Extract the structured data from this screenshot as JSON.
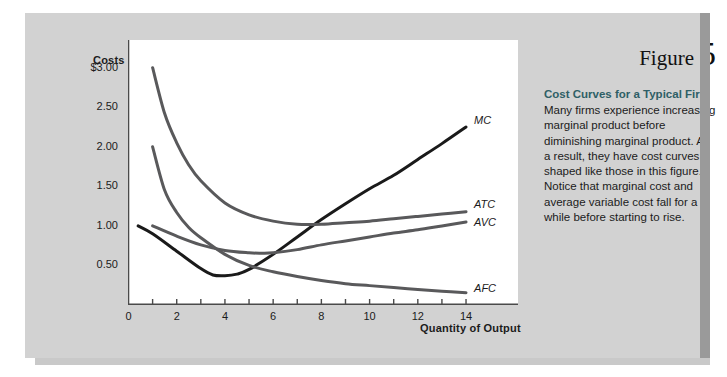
{
  "figure": {
    "word": "Figure",
    "number": "5",
    "caption_title": "Cost Curves for a Typical Firm",
    "caption_body": "Many firms experience increasing marginal product before diminishing marginal product. As a result, they have cost curves shaped like those in this figure. Notice that marginal cost and average variable cost fall for a while before starting to rise.",
    "title_color": "#2f5f66"
  },
  "chart_data": {
    "type": "line",
    "title": "Cost Curves for a Typical Firm",
    "xlabel": "Quantity of Output",
    "ylabel": "Costs",
    "xlim": [
      0,
      14.6
    ],
    "ylim": [
      0,
      3.35
    ],
    "grid": false,
    "legend": "inline-right-labels",
    "xticks": [
      0,
      1,
      2,
      3,
      4,
      5,
      6,
      7,
      8,
      9,
      10,
      11,
      12,
      13,
      14
    ],
    "xtick_labels": [
      "0",
      "",
      "2",
      "",
      "4",
      "",
      "6",
      "",
      "8",
      "",
      "10",
      "",
      "12",
      "",
      "14"
    ],
    "yticks": [
      0.25,
      0.5,
      0.75,
      1.0,
      1.25,
      1.5,
      1.75,
      2.0,
      2.25,
      2.5,
      2.75,
      3.0
    ],
    "ytick_labels": [
      "",
      "0.50",
      "",
      "1.00",
      "",
      "1.50",
      "",
      "2.00",
      "",
      "2.50",
      "",
      "$3.00"
    ],
    "series": [
      {
        "name": "MC",
        "label": "MC",
        "color": "#1a1a1a",
        "width": 3.0,
        "x": [
          0.4,
          1,
          2,
          3,
          3.5,
          4,
          4.5,
          5,
          6,
          7,
          8,
          9,
          10,
          11,
          12,
          13,
          14
        ],
        "y": [
          1.0,
          0.9,
          0.68,
          0.46,
          0.38,
          0.37,
          0.39,
          0.45,
          0.64,
          0.86,
          1.08,
          1.28,
          1.47,
          1.64,
          1.84,
          2.04,
          2.25
        ]
      },
      {
        "name": "ATC",
        "label": "ATC",
        "color": "#59595b",
        "width": 3.0,
        "x": [
          1,
          1.5,
          2,
          2.5,
          3,
          4,
          5,
          6,
          7,
          8,
          9,
          10,
          11,
          12,
          13,
          14
        ],
        "y": [
          3.0,
          2.42,
          2.05,
          1.77,
          1.57,
          1.29,
          1.14,
          1.06,
          1.02,
          1.02,
          1.04,
          1.06,
          1.09,
          1.12,
          1.15,
          1.18
        ]
      },
      {
        "name": "AVC",
        "label": "AVC",
        "color": "#59595b",
        "width": 3.0,
        "x": [
          1,
          2,
          3,
          4,
          5,
          5.5,
          6,
          7,
          8,
          9,
          10,
          11,
          12,
          13,
          14
        ],
        "y": [
          1.0,
          0.87,
          0.76,
          0.69,
          0.66,
          0.655,
          0.66,
          0.7,
          0.76,
          0.81,
          0.86,
          0.91,
          0.95,
          1.0,
          1.05
        ]
      },
      {
        "name": "AFC",
        "label": "AFC",
        "color": "#59595b",
        "width": 3.0,
        "x": [
          1,
          1.5,
          2,
          2.5,
          3,
          4,
          5,
          6,
          7,
          8,
          9,
          10,
          11,
          12,
          13,
          14
        ],
        "y": [
          2.0,
          1.45,
          1.17,
          0.98,
          0.85,
          0.64,
          0.5,
          0.42,
          0.36,
          0.31,
          0.27,
          0.245,
          0.22,
          0.195,
          0.175,
          0.155
        ]
      }
    ],
    "curve_label_positions": [
      {
        "name": "MC",
        "x": 14.25,
        "y": 2.32
      },
      {
        "name": "ATC",
        "x": 14.25,
        "y": 1.26
      },
      {
        "name": "AVC",
        "x": 14.25,
        "y": 1.04
      },
      {
        "name": "AFC",
        "x": 14.25,
        "y": 0.205
      }
    ]
  }
}
